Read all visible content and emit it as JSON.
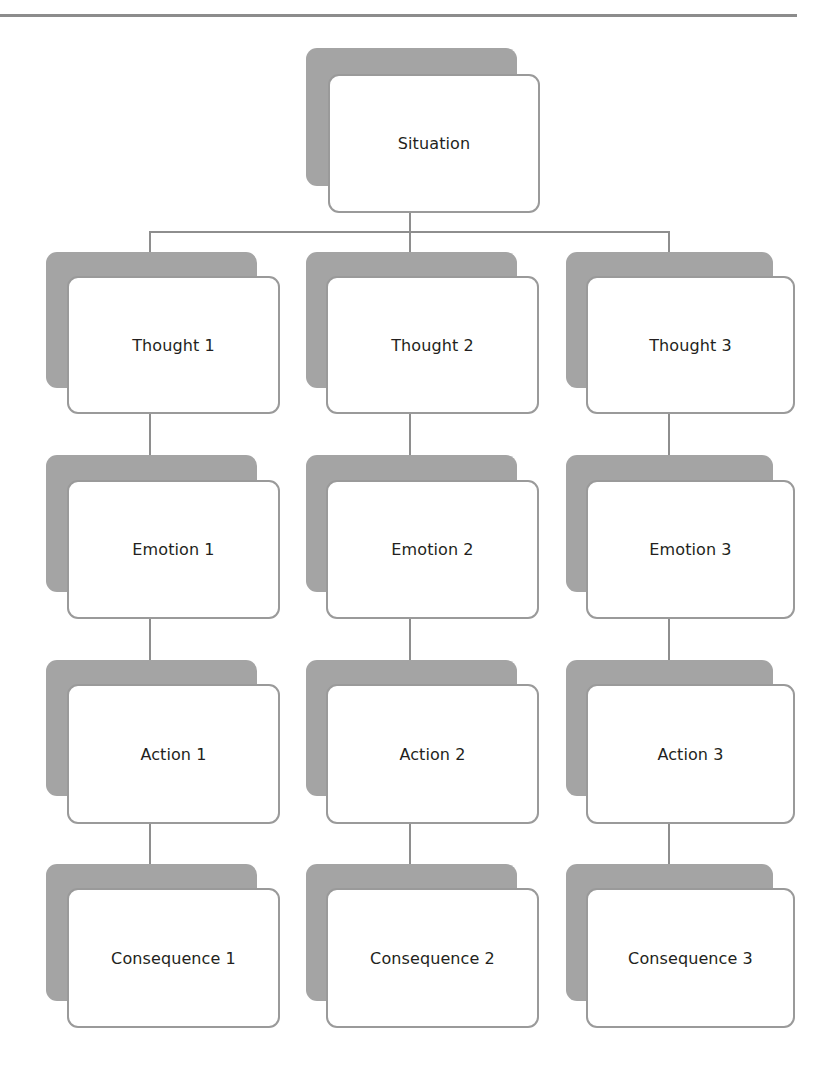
{
  "diagram": {
    "type": "hierarchy-flow",
    "root": {
      "label": "Situation"
    },
    "columns": [
      {
        "thought": "Thought 1",
        "emotion": "Emotion 1",
        "action": "Action 1",
        "consequence": "Consequence 1"
      },
      {
        "thought": "Thought 2",
        "emotion": "Emotion 2",
        "action": "Action 2",
        "consequence": "Consequence 2"
      },
      {
        "thought": "Thought 3",
        "emotion": "Emotion 3",
        "action": "Action 3",
        "consequence": "Consequence 3"
      }
    ],
    "edges": [
      [
        "Situation",
        "Thought 1"
      ],
      [
        "Situation",
        "Thought 2"
      ],
      [
        "Situation",
        "Thought 3"
      ],
      [
        "Thought 1",
        "Emotion 1"
      ],
      [
        "Emotion 1",
        "Action 1"
      ],
      [
        "Action 1",
        "Consequence 1"
      ],
      [
        "Thought 2",
        "Emotion 2"
      ],
      [
        "Emotion 2",
        "Action 2"
      ],
      [
        "Action 2",
        "Consequence 2"
      ],
      [
        "Thought 3",
        "Emotion 3"
      ],
      [
        "Emotion 3",
        "Action 3"
      ],
      [
        "Action 3",
        "Consequence 3"
      ]
    ]
  },
  "colors": {
    "shadow": "#a4a4a4",
    "card_border": "#9a9a9a",
    "connector": "#8e8e8e",
    "text": "#231f20",
    "rule": "#8c8c8c"
  }
}
